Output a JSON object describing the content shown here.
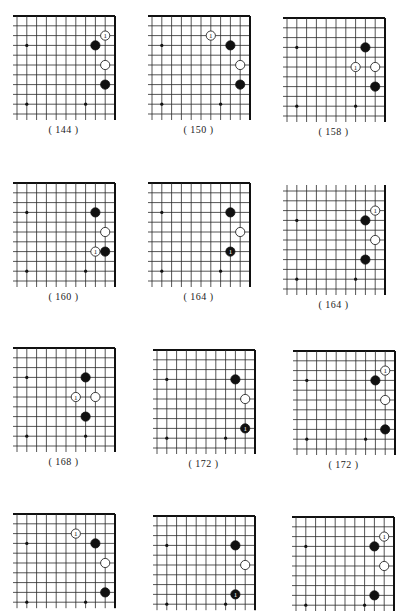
{
  "page": {
    "grid": {
      "cols": 11,
      "rows": 11,
      "spacing": 9.8
    },
    "colors": {
      "line": "#2a2a2a",
      "edge": "#111111",
      "black_stone": "#111111",
      "white_stone": "#ffffff",
      "background": "#ffffff"
    }
  },
  "diagrams": [
    {
      "id": "d1",
      "caption": "( 144 )",
      "x": 10,
      "y": 16,
      "top_edge": true,
      "rows": 11,
      "stones": [
        {
          "c": 9,
          "r": 2,
          "color": "white",
          "label": "1"
        },
        {
          "c": 8,
          "r": 3,
          "color": "black",
          "label": ""
        },
        {
          "c": 9,
          "r": 5,
          "color": "white",
          "label": ""
        },
        {
          "c": 9,
          "r": 7,
          "color": "black",
          "label": ""
        }
      ]
    },
    {
      "id": "d2",
      "caption": "( 150 )",
      "x": 145,
      "y": 16,
      "top_edge": true,
      "rows": 11,
      "stones": [
        {
          "c": 6,
          "r": 2,
          "color": "white",
          "label": "1"
        },
        {
          "c": 8,
          "r": 3,
          "color": "black",
          "label": ""
        },
        {
          "c": 9,
          "r": 5,
          "color": "white",
          "label": ""
        },
        {
          "c": 9,
          "r": 7,
          "color": "black",
          "label": ""
        }
      ]
    },
    {
      "id": "d3",
      "caption": "( 158 )",
      "x": 280,
      "y": 18,
      "top_edge": true,
      "rows": 11,
      "stones": [
        {
          "c": 8,
          "r": 3,
          "color": "black",
          "label": ""
        },
        {
          "c": 7,
          "r": 5,
          "color": "white",
          "label": "1"
        },
        {
          "c": 9,
          "r": 5,
          "color": "white",
          "label": ""
        },
        {
          "c": 9,
          "r": 7,
          "color": "black",
          "label": ""
        }
      ]
    },
    {
      "id": "d4",
      "caption": "( 160 )",
      "x": 10,
      "y": 183,
      "top_edge": true,
      "rows": 11,
      "stones": [
        {
          "c": 8,
          "r": 3,
          "color": "black",
          "label": ""
        },
        {
          "c": 9,
          "r": 5,
          "color": "white",
          "label": ""
        },
        {
          "c": 8,
          "r": 7,
          "color": "white",
          "label": "1"
        },
        {
          "c": 9,
          "r": 7,
          "color": "black",
          "label": ""
        }
      ]
    },
    {
      "id": "d5",
      "caption": "( 164 )",
      "x": 145,
      "y": 183,
      "top_edge": true,
      "rows": 11,
      "stones": [
        {
          "c": 8,
          "r": 3,
          "color": "black",
          "label": ""
        },
        {
          "c": 9,
          "r": 5,
          "color": "white",
          "label": ""
        },
        {
          "c": 8,
          "r": 7,
          "color": "black",
          "label": "1"
        }
      ]
    },
    {
      "id": "d6",
      "caption": "( 164 )",
      "x": 280,
      "y": 185,
      "top_edge": false,
      "rows": 11,
      "stones": [
        {
          "c": 9,
          "r": 2,
          "color": "white",
          "label": "1"
        },
        {
          "c": 8,
          "r": 3,
          "color": "black",
          "label": ""
        },
        {
          "c": 9,
          "r": 5,
          "color": "white",
          "label": ""
        },
        {
          "c": 8,
          "r": 7,
          "color": "black",
          "label": ""
        }
      ]
    },
    {
      "id": "d7",
      "caption": "( 168 )",
      "x": 10,
      "y": 348,
      "top_edge": true,
      "rows": 11,
      "stones": [
        {
          "c": 7,
          "r": 3,
          "color": "black",
          "label": ""
        },
        {
          "c": 6,
          "r": 5,
          "color": "white",
          "label": "1"
        },
        {
          "c": 8,
          "r": 5,
          "color": "white",
          "label": ""
        },
        {
          "c": 7,
          "r": 7,
          "color": "black",
          "label": ""
        }
      ]
    },
    {
      "id": "d8",
      "caption": "( 172 )",
      "x": 150,
      "y": 350,
      "top_edge": true,
      "rows": 11,
      "stones": [
        {
          "c": 8,
          "r": 3,
          "color": "black",
          "label": ""
        },
        {
          "c": 9,
          "r": 5,
          "color": "white",
          "label": ""
        },
        {
          "c": 9,
          "r": 8,
          "color": "black",
          "label": "1"
        }
      ]
    },
    {
      "id": "d9",
      "caption": "( 172 )",
      "x": 290,
      "y": 351,
      "top_edge": true,
      "rows": 11,
      "stones": [
        {
          "c": 9,
          "r": 2,
          "color": "white",
          "label": "1"
        },
        {
          "c": 8,
          "r": 3,
          "color": "black",
          "label": ""
        },
        {
          "c": 9,
          "r": 5,
          "color": "white",
          "label": ""
        },
        {
          "c": 9,
          "r": 8,
          "color": "black",
          "label": ""
        }
      ]
    },
    {
      "id": "d10",
      "caption": "",
      "x": 10,
      "y": 514,
      "top_edge": true,
      "rows": 10,
      "stones": [
        {
          "c": 6,
          "r": 2,
          "color": "white",
          "label": "1"
        },
        {
          "c": 8,
          "r": 3,
          "color": "black",
          "label": ""
        },
        {
          "c": 9,
          "r": 5,
          "color": "white",
          "label": ""
        },
        {
          "c": 9,
          "r": 8,
          "color": "black",
          "label": ""
        }
      ]
    },
    {
      "id": "d11",
      "caption": "",
      "x": 150,
      "y": 516,
      "top_edge": true,
      "rows": 10,
      "stones": [
        {
          "c": 8,
          "r": 3,
          "color": "black",
          "label": ""
        },
        {
          "c": 9,
          "r": 5,
          "color": "white",
          "label": ""
        },
        {
          "c": 8,
          "r": 8,
          "color": "black",
          "label": "1"
        }
      ]
    },
    {
      "id": "d12",
      "caption": "",
      "x": 289,
      "y": 517,
      "top_edge": true,
      "rows": 10,
      "stones": [
        {
          "c": 9,
          "r": 2,
          "color": "white",
          "label": "1"
        },
        {
          "c": 8,
          "r": 3,
          "color": "black",
          "label": ""
        },
        {
          "c": 9,
          "r": 5,
          "color": "white",
          "label": ""
        },
        {
          "c": 8,
          "r": 8,
          "color": "black",
          "label": ""
        }
      ]
    }
  ],
  "hoshi": [
    {
      "c": 1,
      "r": 3
    },
    {
      "c": 1,
      "r": 9
    },
    {
      "c": 7,
      "r": 9
    }
  ]
}
